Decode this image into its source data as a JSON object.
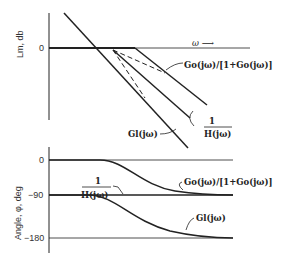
{
  "top_plot": {
    "ylabel": "Lm, db",
    "zero_tick": "0",
    "omega_label": "ω ⟶",
    "curves": {
      "closed_loop": "Go(jω)/[1+Go(jω)]",
      "inverse_feedback_num": "1",
      "inverse_feedback_den": "H(jω)",
      "G_l": "Gl(jω)"
    }
  },
  "bottom_plot": {
    "ylabel": "Angle, φ, deg",
    "ticks": [
      "0",
      "−90",
      "−180"
    ],
    "curves": {
      "inverse_feedback_num": "1",
      "inverse_feedback_den": "H(jω)",
      "closed_loop": "Go(jω)/[1+Go(jω)]",
      "G_l": "Gl(jω)"
    }
  }
}
